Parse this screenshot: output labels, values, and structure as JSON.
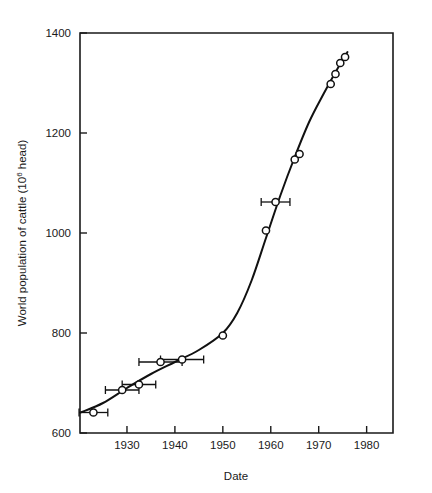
{
  "chart_data": {
    "type": "scatter",
    "title": "",
    "xlabel": "Date",
    "ylabel": "World population of cattle (10⁶ head)",
    "ylabel_main": "World population of cattle (10",
    "ylabel_exponent": "6",
    "ylabel_tail": " head)",
    "xlim": [
      1920.2,
      1985.5
    ],
    "ylim": [
      600,
      1400
    ],
    "xticks": [
      1930,
      1940,
      1950,
      1960,
      1970,
      1980
    ],
    "xtick_labels": [
      "1930",
      "1940",
      "1950",
      "1960",
      "1970",
      "1980"
    ],
    "yticks": [
      600,
      800,
      1000,
      1200,
      1400
    ],
    "ytick_labels": [
      "600",
      "800",
      "1000",
      "1200",
      "1400"
    ],
    "grid": false,
    "legend_position": "none",
    "marker_style": "open-circle",
    "line_style": "solid-smooth-fit",
    "points": [
      {
        "x": 1923.0,
        "y": 641,
        "xerr": 3.0
      },
      {
        "x": 1929.0,
        "y": 686,
        "xerr": 3.5
      },
      {
        "x": 1932.5,
        "y": 697,
        "xerr": 3.5
      },
      {
        "x": 1937.0,
        "y": 742,
        "xerr": 4.5
      },
      {
        "x": 1941.5,
        "y": 747,
        "xerr": 4.5
      },
      {
        "x": 1950.0,
        "y": 795,
        "xerr": 0
      },
      {
        "x": 1959.0,
        "y": 1005,
        "xerr": 0
      },
      {
        "x": 1961.0,
        "y": 1062,
        "xerr": 3.0
      },
      {
        "x": 1965.0,
        "y": 1147,
        "xerr": 0
      },
      {
        "x": 1966.0,
        "y": 1158,
        "xerr": 0
      },
      {
        "x": 1972.5,
        "y": 1298,
        "xerr": 0
      },
      {
        "x": 1973.5,
        "y": 1318,
        "xerr": 0
      },
      {
        "x": 1974.5,
        "y": 1340,
        "xerr": 0
      },
      {
        "x": 1975.5,
        "y": 1352,
        "xerr": 0
      }
    ],
    "fit_curve": [
      {
        "x": 1920.3,
        "y": 641
      },
      {
        "x": 1925.0,
        "y": 660
      },
      {
        "x": 1930.0,
        "y": 690
      },
      {
        "x": 1935.0,
        "y": 718
      },
      {
        "x": 1940.0,
        "y": 742
      },
      {
        "x": 1945.0,
        "y": 766
      },
      {
        "x": 1950.0,
        "y": 800
      },
      {
        "x": 1953.0,
        "y": 840
      },
      {
        "x": 1956.0,
        "y": 905
      },
      {
        "x": 1959.0,
        "y": 990
      },
      {
        "x": 1962.0,
        "y": 1075
      },
      {
        "x": 1965.0,
        "y": 1152
      },
      {
        "x": 1968.0,
        "y": 1222
      },
      {
        "x": 1971.0,
        "y": 1278
      },
      {
        "x": 1974.0,
        "y": 1330
      },
      {
        "x": 1976.0,
        "y": 1362
      }
    ],
    "colors": {
      "axis": "#1a1a1a",
      "curve": "#111111",
      "marker_fill": "#ffffff",
      "marker_stroke": "#111111",
      "background": "#ffffff"
    }
  }
}
